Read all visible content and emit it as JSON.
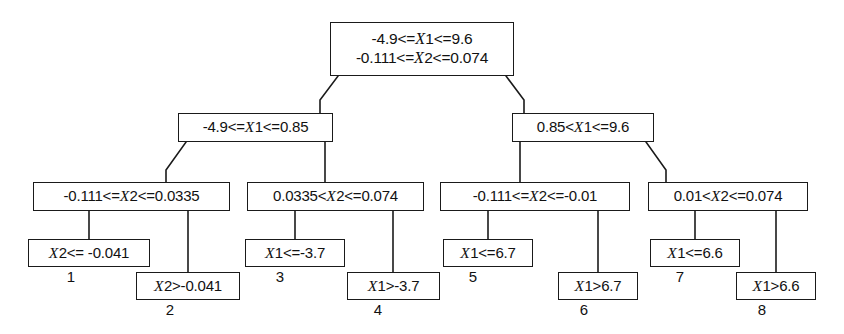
{
  "diagram": {
    "type": "decision-tree",
    "stroke_color": "#1a1a1a",
    "background_color": "#ffffff"
  },
  "nodes": {
    "root": {
      "id": "root",
      "line1": "-4.9<=X1<=9.6",
      "line2": "-0.111<=X2<=0.074",
      "x": 330,
      "y": 22,
      "w": 184,
      "h": 54
    },
    "split_l": {
      "id": "split-left",
      "text": "-4.9<=X1<=0.85",
      "x": 178,
      "y": 113,
      "w": 155,
      "h": 29
    },
    "split_r": {
      "id": "split-right",
      "text": "0.85<X1<=9.6",
      "x": 512,
      "y": 113,
      "w": 142,
      "h": 29
    },
    "split_ll": {
      "id": "split-left-left",
      "text": "-0.111<=X2<=0.0335",
      "x": 33,
      "y": 182,
      "w": 197,
      "h": 29
    },
    "split_lr": {
      "id": "split-left-right",
      "text": "0.0335<X2<=0.074",
      "x": 247,
      "y": 182,
      "w": 177,
      "h": 29
    },
    "split_rl": {
      "id": "split-right-left",
      "text": "-0.111<=X2<=-0.01",
      "x": 440,
      "y": 182,
      "w": 190,
      "h": 29
    },
    "split_rr": {
      "id": "split-right-right",
      "text": "0.01<X2<=0.074",
      "x": 648,
      "y": 182,
      "w": 160,
      "h": 29
    }
  },
  "leaves": [
    {
      "id": "leaf-1",
      "text": "X2<= -0.041",
      "number": "1",
      "x": 28,
      "y": 239,
      "w": 122,
      "h": 28,
      "num_x": 61,
      "num_y": 268
    },
    {
      "id": "leaf-2",
      "text": "X2>-0.041",
      "number": "2",
      "x": 136,
      "y": 272,
      "w": 104,
      "h": 28,
      "num_x": 160,
      "num_y": 301
    },
    {
      "id": "leaf-3",
      "text": "X1<=-3.7",
      "number": "3",
      "x": 245,
      "y": 239,
      "w": 100,
      "h": 28,
      "num_x": 270,
      "num_y": 268
    },
    {
      "id": "leaf-4",
      "text": "X1>-3.7",
      "number": "4",
      "x": 347,
      "y": 272,
      "w": 93,
      "h": 28,
      "num_x": 368,
      "num_y": 301
    },
    {
      "id": "leaf-5",
      "text": "X1<=6.7",
      "number": "5",
      "x": 443,
      "y": 239,
      "w": 90,
      "h": 28,
      "num_x": 463,
      "num_y": 268
    },
    {
      "id": "leaf-6",
      "text": "X1>6.7",
      "number": "6",
      "x": 558,
      "y": 272,
      "w": 80,
      "h": 28,
      "num_x": 574,
      "num_y": 301
    },
    {
      "id": "leaf-7",
      "text": "X1<=6.6",
      "number": "7",
      "x": 650,
      "y": 239,
      "w": 90,
      "h": 28,
      "num_x": 670,
      "num_y": 268
    },
    {
      "id": "leaf-8",
      "text": "X1>6.6",
      "number": "8",
      "x": 736,
      "y": 272,
      "w": 80,
      "h": 28,
      "num_x": 752,
      "num_y": 301
    }
  ],
  "edges": {
    "description": "Diagonal drops from parent box bottom corners to child box top corners; vertical drops to leaf boxes."
  }
}
